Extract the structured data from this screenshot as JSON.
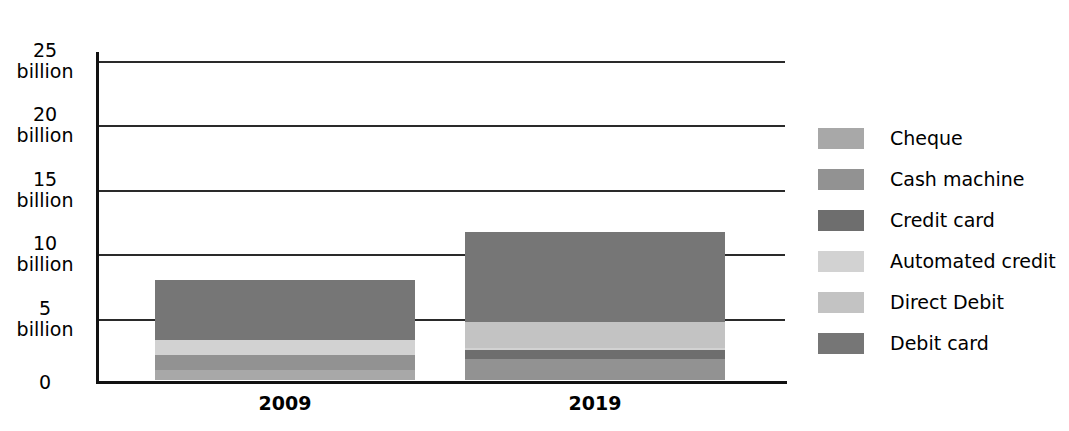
{
  "chart_data": {
    "type": "bar",
    "subtype": "stacked-bar",
    "title": "",
    "xlabel": "",
    "ylabel": "",
    "categories": [
      "2009",
      "2019"
    ],
    "ylim": [
      0,
      25
    ],
    "yticks": [
      0,
      5,
      10,
      15,
      20,
      25
    ],
    "ytick_labels": [
      "0",
      "5 billion",
      "10 billion",
      "15 billion",
      "20 billion",
      "25 billion"
    ],
    "y_unit": "billion",
    "grid": true,
    "legend_position": "right",
    "series": [
      {
        "name": "Cheque",
        "values": [
          1.0,
          0.0
        ],
        "color": "#a8a8a8"
      },
      {
        "name": "Cash machine",
        "values": [
          2.2,
          1.9
        ],
        "color": "#929292"
      },
      {
        "name": "Credit card",
        "values": [
          1.6,
          2.6
        ],
        "color": "#6e6e6e"
      },
      {
        "name": "Automated credit",
        "values": [
          3.3,
          2.7
        ],
        "color": "#d2d2d2"
      },
      {
        "name": "Direct Debit",
        "values": [
          1.5,
          4.7
        ],
        "color": "#c3c3c3"
      },
      {
        "name": "Debit card",
        "values": [
          8.0,
          11.7
        ],
        "color": "#767676"
      }
    ],
    "totals": [
      17.6,
      23.6
    ]
  },
  "axis": {
    "ticks": [
      {
        "value": 25,
        "num": "25",
        "unit": "billion"
      },
      {
        "value": 20,
        "num": "20",
        "unit": "billion"
      },
      {
        "value": 15,
        "num": "15",
        "unit": "billion"
      },
      {
        "value": 10,
        "num": "10",
        "unit": "billion"
      },
      {
        "value": 5,
        "num": "5",
        "unit": "billion"
      },
      {
        "value": 0,
        "num": "0",
        "unit": ""
      }
    ]
  },
  "legend": {
    "items": [
      {
        "label": "Cheque",
        "color": "#a8a8a8"
      },
      {
        "label": "Cash machine",
        "color": "#929292"
      },
      {
        "label": "Credit card",
        "color": "#6e6e6e"
      },
      {
        "label": "Automated credit",
        "color": "#d2d2d2"
      },
      {
        "label": "Direct Debit",
        "color": "#c3c3c3"
      },
      {
        "label": "Debit card",
        "color": "#767676"
      }
    ]
  },
  "x_labels": [
    "2009",
    "2019"
  ],
  "geometry": {
    "baseline_y": 383,
    "top_y": 61,
    "px_per_unit": 12.88,
    "bar_width": 260,
    "bar_left": [
      155,
      465
    ],
    "segment_gap": 3
  }
}
